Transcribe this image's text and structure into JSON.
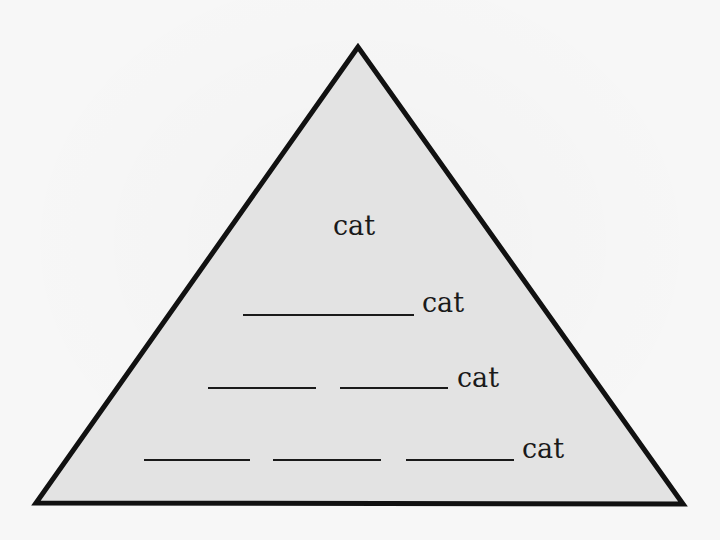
{
  "diagram": {
    "type": "pyramid",
    "fill_color": "#e3e3e3",
    "stroke_color": "#111111",
    "levels": [
      {
        "blanks": 0,
        "label": "cat"
      },
      {
        "blanks": 1,
        "label": "cat"
      },
      {
        "blanks": 2,
        "label": "cat"
      },
      {
        "blanks": 3,
        "label": "cat"
      }
    ]
  }
}
